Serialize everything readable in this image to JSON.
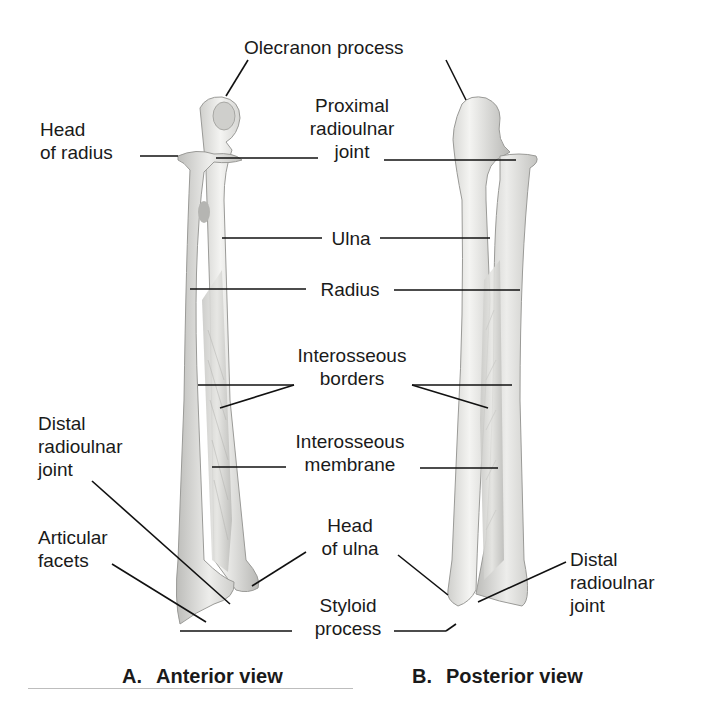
{
  "figure": {
    "views": [
      {
        "letter": "A.",
        "title": "Anterior view"
      },
      {
        "letter": "B.",
        "title": "Posterior view"
      }
    ],
    "labels": {
      "olecranon": "Olecranon process",
      "head_radius": [
        "Head",
        "of radius"
      ],
      "proximal_joint": [
        "Proximal",
        "radioulnar",
        "joint"
      ],
      "ulna": "Ulna",
      "radius": "Radius",
      "interosseous_borders": [
        "Interosseous",
        "borders"
      ],
      "interosseous_membrane": [
        "Interosseous",
        "membrane"
      ],
      "distal_joint_left": [
        "Distal",
        "radioulnar",
        "joint"
      ],
      "articular_facets": [
        "Articular",
        "facets"
      ],
      "head_ulna": [
        "Head",
        "of ulna"
      ],
      "styloid": [
        "Styloid",
        "process"
      ],
      "distal_joint_right": [
        "Distal",
        "radioulnar",
        "joint"
      ]
    },
    "colors": {
      "bone_light": "#f2f2f0",
      "bone_mid": "#d9d9d6",
      "bone_dark": "#a9a9a6",
      "leader": "#111111"
    }
  }
}
